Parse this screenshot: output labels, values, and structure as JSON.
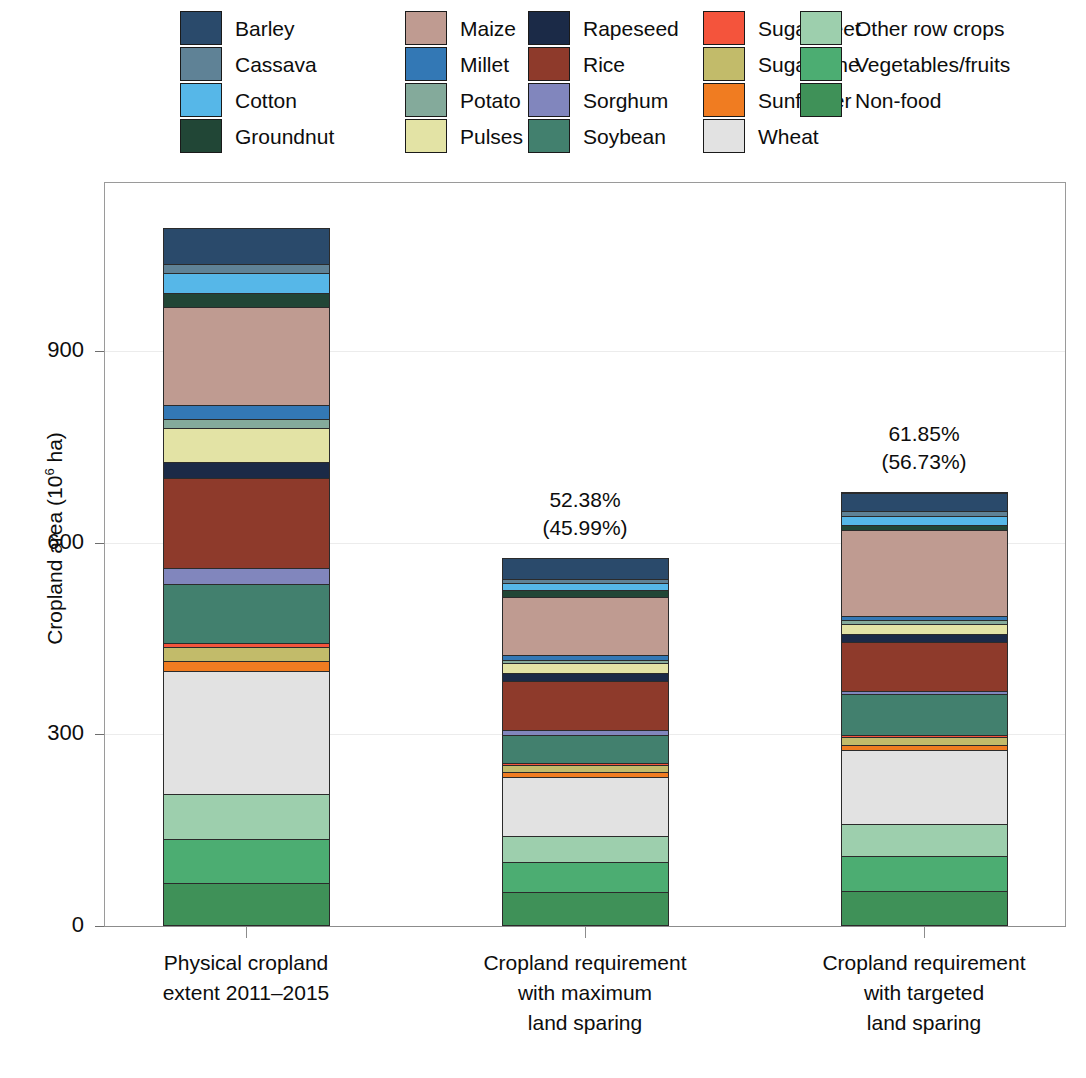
{
  "legend": {
    "columns": [
      {
        "items": [
          {
            "label": "Barley",
            "color": "#2a4a6b"
          },
          {
            "label": "Cassava",
            "color": "#5f8296"
          },
          {
            "label": "Cotton",
            "color": "#56b7e8"
          },
          {
            "label": "Groundnut",
            "color": "#214636"
          }
        ]
      },
      {
        "items": [
          {
            "label": "Maize",
            "color": "#bf9b91"
          },
          {
            "label": "Millet",
            "color": "#3378b5"
          },
          {
            "label": "Potato",
            "color": "#84aa9b"
          },
          {
            "label": "Pulses",
            "color": "#e3e3a5"
          }
        ]
      },
      {
        "items": [
          {
            "label": "Rapeseed",
            "color": "#1b2a47"
          },
          {
            "label": "Rice",
            "color": "#8e3a2b"
          },
          {
            "label": "Sorghum",
            "color": "#8186bd"
          },
          {
            "label": "Soybean",
            "color": "#42806e"
          }
        ]
      },
      {
        "items": [
          {
            "label": "Sugar beet",
            "color": "#f4543c"
          },
          {
            "label": "Sugarcane",
            "color": "#c2bb6a"
          },
          {
            "label": "Sunflower",
            "color": "#f07c21"
          },
          {
            "label": "Wheat",
            "color": "#e2e2e2"
          }
        ]
      },
      {
        "items": [
          {
            "label": "Other row crops",
            "color": "#9dcfad"
          },
          {
            "label": "Vegetables/fruits",
            "color": "#4cad72"
          },
          {
            "label": "Non-food",
            "color": "#3f9158"
          }
        ]
      }
    ]
  },
  "axes": {
    "ylabel_prefix": "Cropland area (10",
    "ylabel_sup": "6",
    "ylabel_suffix": " ha)",
    "yticks": [
      {
        "value": 0,
        "label": "0"
      },
      {
        "value": 300,
        "label": "300"
      },
      {
        "value": 600,
        "label": "600"
      },
      {
        "value": 900,
        "label": "900"
      }
    ],
    "ymin": 0,
    "ymax": 1165
  },
  "annotations": [
    {
      "bar": 0,
      "line1": "",
      "line2": ""
    },
    {
      "bar": 1,
      "line1": "52.38%",
      "line2": "(45.99%)"
    },
    {
      "bar": 2,
      "line1": "61.85%",
      "line2": "(56.73%)"
    }
  ],
  "chart_data": {
    "type": "bar",
    "subtype": "stacked",
    "title": "",
    "xlabel": "",
    "ylabel": "Cropland area (10^6 ha)",
    "ylim": [
      0,
      1165
    ],
    "grid": true,
    "legend_position": "top",
    "units": "10^6 ha",
    "categories": [
      "Physical cropland extent 2011–2015",
      "Cropland requirement with maximum land sparing",
      "Cropland requirement with targeted land sparing"
    ],
    "category_lines": [
      [
        "Physical cropland",
        "extent 2011–2015"
      ],
      [
        "Cropland requirement",
        "with maximum",
        "land sparing"
      ],
      [
        "Cropland requirement",
        "with targeted",
        "land sparing"
      ]
    ],
    "totals": [
      1093,
      576,
      679
    ],
    "annotation_labels": [
      {
        "percent_primary": "",
        "percent_secondary": ""
      },
      {
        "percent_primary": "52.38%",
        "percent_secondary": "(45.99%)"
      },
      {
        "percent_primary": "61.85%",
        "percent_secondary": "(56.73%)"
      }
    ],
    "stack_order_bottom_to_top": [
      "Non-food",
      "Vegetables/fruits",
      "Other row crops",
      "Wheat",
      "Sunflower",
      "Sugarcane",
      "Sugar beet",
      "Soybean",
      "Sorghum",
      "Rice",
      "Rapeseed",
      "Pulses",
      "Potato",
      "Millet",
      "Maize",
      "Groundnut",
      "Cotton",
      "Cassava",
      "Barley"
    ],
    "series": [
      {
        "name": "Non-food",
        "color": "#3f9158",
        "values": [
          68,
          53,
          55
        ]
      },
      {
        "name": "Vegetables/fruits",
        "color": "#4cad72",
        "values": [
          68,
          48,
          57
        ]
      },
      {
        "name": "Other row crops",
        "color": "#9dcfad",
        "values": [
          70,
          40,
          50
        ]
      },
      {
        "name": "Wheat",
        "color": "#e2e2e2",
        "values": [
          194,
          93,
          117
        ]
      },
      {
        "name": "Sunflower",
        "color": "#f07c21",
        "values": [
          15,
          7,
          8
        ]
      },
      {
        "name": "Sugarcane",
        "color": "#c2bb6a",
        "values": [
          22,
          11,
          13
        ]
      },
      {
        "name": "Sugar beet",
        "color": "#f4543c",
        "values": [
          6,
          3,
          4
        ]
      },
      {
        "name": "Soybean",
        "color": "#42806e",
        "values": [
          92,
          44,
          64
        ]
      },
      {
        "name": "Sorghum",
        "color": "#8186bd",
        "values": [
          25,
          8,
          5
        ]
      },
      {
        "name": "Rice",
        "color": "#8e3a2b",
        "values": [
          141,
          78,
          78
        ]
      },
      {
        "name": "Rapeseed",
        "color": "#1b2a47",
        "values": [
          25,
          12,
          13
        ]
      },
      {
        "name": "Pulses",
        "color": "#e3e3a5",
        "values": [
          54,
          15,
          16
        ]
      },
      {
        "name": "Potato",
        "color": "#84aa9b",
        "values": [
          14,
          6,
          7
        ]
      },
      {
        "name": "Millet",
        "color": "#3378b5",
        "values": [
          22,
          7,
          5
        ]
      },
      {
        "name": "Maize",
        "color": "#bf9b91",
        "values": [
          154,
          92,
          137
        ]
      },
      {
        "name": "Groundnut",
        "color": "#214636",
        "values": [
          22,
          10,
          9
        ]
      },
      {
        "name": "Cotton",
        "color": "#56b7e8",
        "values": [
          30,
          11,
          14
        ]
      },
      {
        "name": "Cassava",
        "color": "#5f8296",
        "values": [
          15,
          7,
          8
        ]
      },
      {
        "name": "Barley",
        "color": "#2a4a6b",
        "values": [
          56,
          32,
          29
        ]
      }
    ]
  }
}
